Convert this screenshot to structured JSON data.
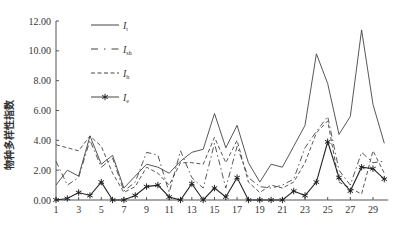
{
  "chart_data": {
    "type": "line",
    "title": "",
    "xlabel": "",
    "ylabel": "物种多样性指数",
    "ylim": [
      0,
      12
    ],
    "yticks": [
      "0.00",
      "2.00",
      "4.00",
      "6.00",
      "8.00",
      "10.00",
      "12.00"
    ],
    "xticks": [
      "1",
      "3",
      "5",
      "7",
      "9",
      "11",
      "13",
      "15",
      "17",
      "19",
      "21",
      "23",
      "25",
      "27",
      "29"
    ],
    "x": [
      1,
      2,
      3,
      4,
      5,
      6,
      7,
      8,
      9,
      10,
      11,
      12,
      13,
      14,
      15,
      16,
      17,
      18,
      19,
      20,
      21,
      22,
      23,
      24,
      25,
      26,
      27,
      28,
      29,
      30
    ],
    "grid": false,
    "legend_position": "upper-left",
    "series": [
      {
        "name": "I_t",
        "label_main": "I",
        "label_sub": "t",
        "style": "solid",
        "values": [
          1.0,
          2.0,
          1.6,
          4.3,
          2.4,
          3.0,
          0.8,
          1.6,
          2.4,
          2.2,
          1.8,
          2.6,
          3.2,
          3.4,
          5.8,
          3.5,
          5.0,
          2.5,
          1.2,
          2.4,
          2.2,
          3.6,
          5.0,
          9.8,
          7.8,
          4.4,
          5.6,
          11.4,
          6.4,
          3.8
        ]
      },
      {
        "name": "I_sh",
        "label_main": "I",
        "label_sub": "sh",
        "style": "dashdot",
        "values": [
          2.6,
          1.0,
          1.5,
          4.0,
          2.2,
          2.8,
          0.6,
          1.2,
          3.2,
          3.0,
          0.5,
          3.3,
          1.5,
          0.8,
          3.8,
          0.8,
          3.6,
          1.5,
          0.9,
          0.8,
          1.0,
          1.4,
          3.5,
          4.6,
          5.6,
          2.0,
          1.0,
          3.2,
          2.5,
          2.6
        ]
      },
      {
        "name": "I_h",
        "label_main": "I",
        "label_sub": "h",
        "style": "dashed",
        "values": [
          3.7,
          3.5,
          3.3,
          4.3,
          3.6,
          1.8,
          0.5,
          0.9,
          2.2,
          1.8,
          1.0,
          2.5,
          2.5,
          2.4,
          4.2,
          2.5,
          4.0,
          1.2,
          0.5,
          1.0,
          0.8,
          1.2,
          2.5,
          4.5,
          5.3,
          1.2,
          0.8,
          0.4,
          3.3,
          1.8
        ]
      },
      {
        "name": "I_e",
        "label_main": "I",
        "label_sub": "e",
        "style": "solid-asterisk",
        "values": [
          0.0,
          0.1,
          0.5,
          0.3,
          1.2,
          0.0,
          0.0,
          0.3,
          0.9,
          1.0,
          0.2,
          0.0,
          1.1,
          0.0,
          0.8,
          0.2,
          1.5,
          0.0,
          0.0,
          0.0,
          0.0,
          0.6,
          0.3,
          1.2,
          3.9,
          1.5,
          0.6,
          2.2,
          2.1,
          1.4
        ]
      }
    ]
  }
}
